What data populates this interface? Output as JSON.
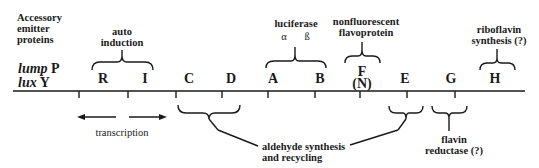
{
  "diagram": {
    "strains": [
      {
        "italic": "lump",
        "suffix": "P"
      },
      {
        "italic": "lux",
        "suffix": "Y"
      }
    ],
    "genes": [
      "R",
      "I",
      "C",
      "D",
      "A",
      "B",
      "F",
      "E",
      "G",
      "H"
    ],
    "gene_f_alt": "(N)",
    "annotations": {
      "accessory": [
        "Accessory",
        "emitter",
        "proteins"
      ],
      "autoinduction": [
        "auto",
        "induction"
      ],
      "luciferase": "luciferase",
      "alpha": "α",
      "beta": "ß",
      "nonfluorescent": [
        "nonfluorescent",
        "flavoprotein"
      ],
      "riboflavin": [
        "riboflavin",
        "synthesis (?)"
      ],
      "transcription": "transcription",
      "aldehyde": [
        "aldehyde synthesis",
        "and recycling"
      ],
      "flavin_reductase": [
        "flavin",
        "reductase (?)"
      ]
    }
  }
}
